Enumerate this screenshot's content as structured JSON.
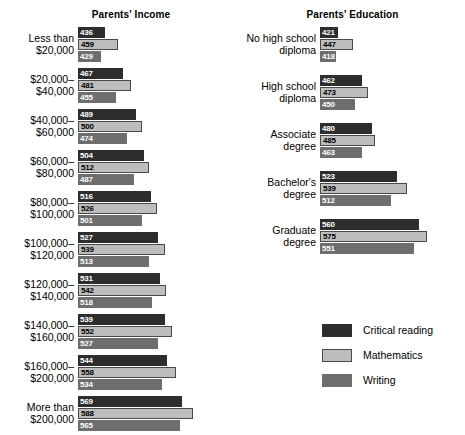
{
  "chart_data": {
    "type": "bar",
    "orientation": "horizontal",
    "title": "",
    "xlabel": "",
    "ylabel": "",
    "xlim": [
      390,
      600
    ],
    "grid": false,
    "legend_position": "bottom-right",
    "series_names": [
      "Critical reading",
      "Mathematics",
      "Writing"
    ],
    "panels": [
      {
        "title": "Parents' Income",
        "categories": [
          "Less than\n$20,000",
          "$20,000–\n$40,000",
          "$40,000–\n$60,000",
          "$60,000–\n$80,000",
          "$80,000–\n$100,000",
          "$100,000–\n$120,000",
          "$120,000–\n$140,000",
          "$140,000–\n$160,000",
          "$160,000–\n$200,000",
          "More than\n$200,000"
        ],
        "series": [
          {
            "name": "Critical reading",
            "values": [
              436,
              467,
              489,
              504,
              516,
              527,
              531,
              539,
              544,
              569
            ]
          },
          {
            "name": "Mathematics",
            "values": [
              459,
              481,
              500,
              512,
              526,
              539,
              542,
              552,
              558,
              588
            ]
          },
          {
            "name": "Writing",
            "values": [
              429,
              455,
              474,
              487,
              501,
              513,
              518,
              527,
              534,
              565
            ]
          }
        ]
      },
      {
        "title": "Parents' Education",
        "categories": [
          "No high school\ndiploma",
          "High school\ndiploma",
          "Associate\ndegree",
          "Bachelor's\ndegree",
          "Graduate\ndegree"
        ],
        "series": [
          {
            "name": "Critical reading",
            "values": [
              421,
              462,
              480,
              523,
              560
            ]
          },
          {
            "name": "Mathematics",
            "values": [
              447,
              473,
              485,
              539,
              575
            ]
          },
          {
            "name": "Writing",
            "values": [
              418,
              450,
              463,
              512,
              551
            ]
          }
        ]
      }
    ]
  },
  "legend": {
    "items": [
      {
        "label": "Critical reading",
        "color": "#2d2d2d"
      },
      {
        "label": "Mathematics",
        "color": "#bdbdbd"
      },
      {
        "label": "Writing",
        "color": "#6e6e6e"
      }
    ]
  }
}
